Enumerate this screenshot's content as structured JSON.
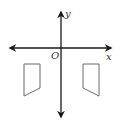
{
  "diagram": {
    "type": "coordinate-plane-reflection",
    "labels": {
      "y_axis": "y",
      "x_axis": "x",
      "origin": "O"
    },
    "colors": {
      "axis": "#1a1a1a",
      "shape_stroke": "#6b6b6b",
      "background": "#ffffff"
    },
    "shapes": [
      {
        "name": "left-quadrilateral",
        "points": [
          [
            24,
            64
          ],
          [
            40,
            64
          ],
          [
            40,
            88
          ],
          [
            24,
            96
          ]
        ]
      },
      {
        "name": "right-quadrilateral",
        "points": [
          [
            83,
            64
          ],
          [
            99,
            64
          ],
          [
            99,
            96
          ],
          [
            83,
            88
          ]
        ]
      }
    ]
  }
}
